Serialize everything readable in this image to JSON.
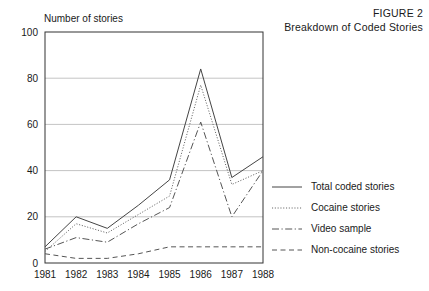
{
  "figure": {
    "number_label": "FIGURE 2",
    "title": "Breakdown of Coded Stories"
  },
  "axes": {
    "y_axis_title": "Number of stories",
    "y_ticks": [
      "0",
      "20",
      "40",
      "60",
      "80",
      "100"
    ],
    "x_ticks": [
      "1981",
      "1982",
      "1983",
      "1984",
      "1985",
      "1986",
      "1987",
      "1988"
    ]
  },
  "legend": {
    "items": [
      {
        "label": "Total coded stories",
        "style": "solid",
        "icon": "solid-line-icon"
      },
      {
        "label": "Cocaine stories",
        "style": "dotted",
        "icon": "dotted-line-icon"
      },
      {
        "label": "Video sample",
        "style": "dashdot",
        "icon": "dash-dot-line-icon"
      },
      {
        "label": "Non-cocaine stories",
        "style": "dashed",
        "icon": "dashed-line-icon"
      }
    ]
  },
  "chart_data": {
    "type": "line",
    "title": "Breakdown of Coded Stories",
    "subtitle": "FIGURE 2",
    "xlabel": "",
    "ylabel": "Number of stories",
    "x": [
      "1981",
      "1982",
      "1983",
      "1984",
      "1985",
      "1986",
      "1987",
      "1988"
    ],
    "ylim": [
      0,
      100
    ],
    "xlim": [
      "1981",
      "1988"
    ],
    "yticks": [
      0,
      20,
      40,
      60,
      80,
      100
    ],
    "grid": "horizontal",
    "legend_position": "right",
    "series": [
      {
        "name": "Total coded stories",
        "style": "solid",
        "color": "#444444",
        "values": [
          7,
          20,
          15,
          25,
          36,
          84,
          37,
          46
        ]
      },
      {
        "name": "Cocaine stories",
        "style": "dotted",
        "color": "#666666",
        "values": [
          5,
          17,
          13,
          21,
          29,
          77,
          34,
          40
        ]
      },
      {
        "name": "Video sample",
        "style": "dashdot",
        "color": "#555555",
        "values": [
          6,
          11,
          9,
          17,
          24,
          61,
          20,
          40
        ]
      },
      {
        "name": "Non-cocaine stories",
        "style": "dashed",
        "color": "#555555",
        "values": [
          4,
          2,
          2,
          4,
          7,
          7,
          7,
          7
        ]
      }
    ]
  }
}
